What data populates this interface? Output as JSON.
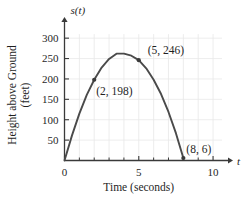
{
  "chart_data": {
    "type": "line",
    "title": "",
    "xlabel": "Time (seconds)",
    "ylabel_line1": "Height above Ground",
    "ylabel_line2": "(feet)",
    "x_axis_symbol": "t",
    "y_axis_symbol": "s(t)",
    "xlim": [
      0,
      11.2
    ],
    "ylim": [
      0,
      320
    ],
    "xticks_major": [
      0,
      5,
      10
    ],
    "xtick_labels": [
      "0",
      "5",
      "10"
    ],
    "xticks_minor": [
      1,
      2,
      3,
      4,
      6,
      7,
      8,
      9
    ],
    "yticks": [
      50,
      100,
      150,
      200,
      250,
      300
    ],
    "ytick_labels": [
      "50",
      "100",
      "150",
      "200",
      "250",
      "300"
    ],
    "grid": true,
    "grid_color": "#e9e9e9",
    "curve_color": "#4a4a4a",
    "axis_color": "#3a3a3a",
    "marker_color": "#3a3a3a",
    "legend": "none",
    "curve_points": [
      {
        "x": 0,
        "y": 0
      },
      {
        "x": 0.5,
        "y": 61
      },
      {
        "x": 1,
        "y": 115
      },
      {
        "x": 1.5,
        "y": 161
      },
      {
        "x": 2,
        "y": 198
      },
      {
        "x": 2.5,
        "y": 228
      },
      {
        "x": 3,
        "y": 249
      },
      {
        "x": 3.5,
        "y": 262
      },
      {
        "x": 4,
        "y": 262
      },
      {
        "x": 4.5,
        "y": 257
      },
      {
        "x": 5,
        "y": 246
      },
      {
        "x": 5.5,
        "y": 226
      },
      {
        "x": 6,
        "y": 198
      },
      {
        "x": 6.5,
        "y": 163
      },
      {
        "x": 7,
        "y": 119
      },
      {
        "x": 7.5,
        "y": 67
      },
      {
        "x": 8,
        "y": 6
      }
    ],
    "marked_points": [
      {
        "x": 2,
        "y": 198,
        "label": "(2, 198)"
      },
      {
        "x": 5,
        "y": 246,
        "label": "(5, 246)"
      },
      {
        "x": 8,
        "y": 6,
        "label": "(8, 6)"
      }
    ]
  }
}
